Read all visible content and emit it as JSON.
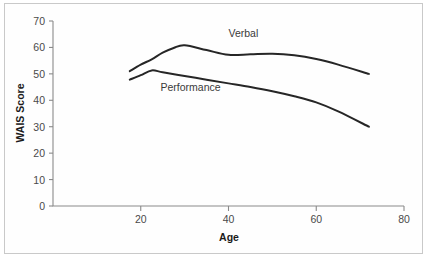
{
  "chart_data": {
    "type": "line",
    "title": "",
    "xlabel": "Age",
    "ylabel": "WAIS Score",
    "xlim": [
      14,
      80
    ],
    "ylim": [
      0,
      70
    ],
    "xticks": [
      20,
      40,
      60,
      80
    ],
    "yticks": [
      0,
      10,
      20,
      30,
      40,
      50,
      60,
      70
    ],
    "xtick_labels": [
      "20",
      "40",
      "60",
      "80"
    ],
    "ytick_labels": [
      "0",
      "10",
      "20",
      "30",
      "40",
      "50",
      "60",
      "70"
    ],
    "grid": false,
    "legend_position": "inline-annotation",
    "line_color": "#262626",
    "axis_color": "#8a8a8a",
    "series": [
      {
        "name": "Verbal",
        "label": "Verbal",
        "label_x": 40,
        "label_y": 64,
        "x": [
          17.5,
          20,
          22.5,
          25,
          27.5,
          30,
          35,
          40,
          45,
          50,
          55,
          60,
          65,
          72
        ],
        "y": [
          51.0,
          53.5,
          55.5,
          58.0,
          59.8,
          60.8,
          59.0,
          57.2,
          57.4,
          57.6,
          57.0,
          55.6,
          53.5,
          50.0
        ]
      },
      {
        "name": "Performance",
        "label": "Performance",
        "label_x": 24.5,
        "label_y": 43.5,
        "x": [
          17.5,
          20,
          22.5,
          25,
          30,
          35,
          40,
          45,
          50,
          55,
          60,
          65,
          72
        ],
        "y": [
          47.8,
          49.5,
          51.3,
          50.6,
          49.2,
          47.8,
          46.4,
          45.0,
          43.4,
          41.5,
          39.2,
          35.8,
          30.0
        ]
      }
    ]
  }
}
